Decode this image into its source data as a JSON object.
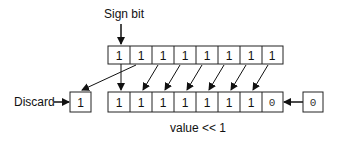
{
  "labels": {
    "sign_bit": "Sign bit",
    "discard": "Discard",
    "caption": "value << 1"
  },
  "top_row": [
    "1",
    "1",
    "1",
    "1",
    "1",
    "1",
    "1",
    "1"
  ],
  "bottom_row": [
    "1",
    "1",
    "1",
    "1",
    "1",
    "1",
    "1",
    "0"
  ],
  "discard_bit": "1",
  "shift_in_bit": "0"
}
